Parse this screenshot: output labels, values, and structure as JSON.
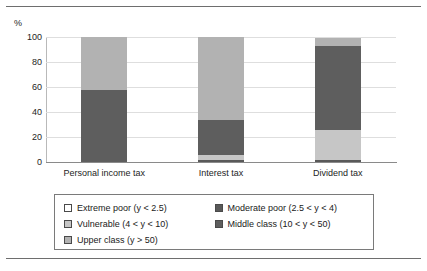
{
  "chart_data": {
    "type": "bar",
    "variant": "stacked-bar-100",
    "title": "",
    "subtitle": "",
    "xlabel": "",
    "ylabel": "%",
    "ylim": [
      0,
      100
    ],
    "yticks": [
      0,
      20,
      40,
      60,
      80,
      100
    ],
    "ytick_labels": [
      "0",
      "20",
      "40",
      "60",
      "80",
      "100"
    ],
    "grid": true,
    "grid_axis": "y",
    "legend_position": "bottom",
    "categories": [
      "Personal income tax",
      "Interest tax",
      "Dividend tax"
    ],
    "series": [
      {
        "name": "Extreme poor (y < 2.5)",
        "color": "#ffffff",
        "values": [
          0,
          0,
          0
        ]
      },
      {
        "name": "Moderate poor (2.5 < y < 4)",
        "color": "#595959",
        "values": [
          0,
          2,
          2
        ]
      },
      {
        "name": "Vulnerable (4 < y < 10)",
        "color": "#c6c6c6",
        "values": [
          0,
          4,
          24
        ]
      },
      {
        "name": "Middle class (10 < y < 50)",
        "color": "#5e5e5e",
        "values": [
          58,
          28,
          67
        ]
      },
      {
        "name": "Upper class (y > 50)",
        "color": "#b2b2b2",
        "values": [
          42,
          66,
          6
        ]
      }
    ],
    "stack_totals": [
      100,
      100,
      99
    ],
    "axis": {
      "percent_symbol": "%"
    }
  },
  "legend": {
    "entries": [
      {
        "label": "Extreme poor (y < 2.5)",
        "color": "#ffffff"
      },
      {
        "label": "Moderate poor (2.5 < y < 4)",
        "color": "#595959"
      },
      {
        "label": "Vulnerable (4 < y < 10)",
        "color": "#c6c6c6"
      },
      {
        "label": "Middle class (10 < y < 50)",
        "color": "#5e5e5e"
      },
      {
        "label": "Upper class (y > 50)",
        "color": "#b2b2b2"
      }
    ]
  },
  "colors": {
    "frame_rule": "#6e6e6e",
    "gridline": "#dedede",
    "baseline": "#8a8a8a",
    "legend_border": "#7a7a7a",
    "text": "#242424",
    "background": "#ffffff"
  }
}
